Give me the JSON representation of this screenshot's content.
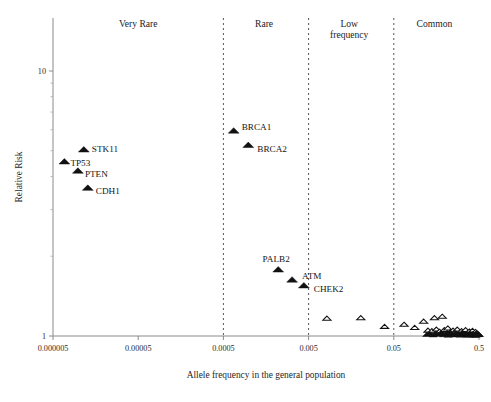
{
  "chart_data": {
    "type": "scatter",
    "title": "",
    "xlabel": "Allele frequency in the general population",
    "ylabel": "Relative Risk",
    "xscale": "log",
    "yscale": "log",
    "xlim": [
      5e-06,
      0.5
    ],
    "ylim": [
      1,
      20
    ],
    "xticks": [
      "0.000005",
      "0.00005",
      "0.0005",
      "0.005",
      "0.05",
      "0.5"
    ],
    "xtick_values": [
      5e-06,
      5e-05,
      0.0005,
      0.005,
      0.05,
      0.5
    ],
    "yticks": [
      "1",
      "10"
    ],
    "ytick_values": [
      1,
      10
    ],
    "grid": false,
    "legend": "none",
    "category_bands": [
      {
        "label": "Very Rare",
        "x_center": 5e-05,
        "range": [
          5e-06,
          0.0005
        ]
      },
      {
        "label": "Rare",
        "x_center": 0.0015,
        "range": [
          0.0005,
          0.005
        ]
      },
      {
        "label": "Low frequency",
        "x_center": 0.015,
        "range": [
          0.005,
          0.05
        ]
      },
      {
        "label": "Common",
        "x_center": 0.15,
        "range": [
          0.05,
          0.5
        ]
      }
    ],
    "separator_values": [
      0.0005,
      0.005,
      0.05
    ],
    "series": [
      {
        "name": "High penetrance / labelled genes",
        "marker": "filled-triangle",
        "points": [
          {
            "label": "TP53",
            "x": 6.8e-06,
            "y": 4.55,
            "label_dx": 6,
            "label_dy": 4
          },
          {
            "label": "STK11",
            "x": 1.15e-05,
            "y": 5.05,
            "label_dx": 8,
            "label_dy": 2
          },
          {
            "label": "PTEN",
            "x": 9.8e-06,
            "y": 4.2,
            "label_dx": 7,
            "label_dy": 6
          },
          {
            "label": "CDH1",
            "x": 1.28e-05,
            "y": 3.62,
            "label_dx": 8,
            "label_dy": 6
          },
          {
            "label": "BRCA1",
            "x": 0.00066,
            "y": 5.95,
            "label_dx": 8,
            "label_dy": -1
          },
          {
            "label": "BRCA2",
            "x": 0.00098,
            "y": 5.25,
            "label_dx": 9,
            "label_dy": 7
          },
          {
            "label": "PALB2",
            "x": 0.0022,
            "y": 1.78,
            "label_dx": -2,
            "label_dy": -8
          },
          {
            "label": "ATM",
            "x": 0.0032,
            "y": 1.63,
            "label_dx": 10,
            "label_dy": -1
          },
          {
            "label": "CHEK2",
            "x": 0.0044,
            "y": 1.55,
            "label_dx": 10,
            "label_dy": 6
          }
        ]
      },
      {
        "name": "Common low-penetrance variants",
        "marker": "open-triangle",
        "points": [
          {
            "x": 0.0082,
            "y": 1.165
          },
          {
            "x": 0.0205,
            "y": 1.17
          },
          {
            "x": 0.039,
            "y": 1.085
          },
          {
            "x": 0.066,
            "y": 1.105
          },
          {
            "x": 0.088,
            "y": 1.075
          },
          {
            "x": 0.112,
            "y": 1.135
          },
          {
            "x": 0.15,
            "y": 1.17
          },
          {
            "x": 0.185,
            "y": 1.185
          },
          {
            "x": 0.126,
            "y": 1.05
          },
          {
            "x": 0.14,
            "y": 1.045
          },
          {
            "x": 0.158,
            "y": 1.06
          },
          {
            "x": 0.172,
            "y": 1.04
          },
          {
            "x": 0.196,
            "y": 1.055
          },
          {
            "x": 0.215,
            "y": 1.07
          },
          {
            "x": 0.232,
            "y": 1.038
          },
          {
            "x": 0.248,
            "y": 1.05
          },
          {
            "x": 0.262,
            "y": 1.032
          },
          {
            "x": 0.278,
            "y": 1.06
          },
          {
            "x": 0.295,
            "y": 1.028
          },
          {
            "x": 0.312,
            "y": 1.045
          },
          {
            "x": 0.33,
            "y": 1.035
          },
          {
            "x": 0.348,
            "y": 1.055
          },
          {
            "x": 0.366,
            "y": 1.025
          },
          {
            "x": 0.385,
            "y": 1.042
          },
          {
            "x": 0.402,
            "y": 1.03
          },
          {
            "x": 0.42,
            "y": 1.048
          },
          {
            "x": 0.438,
            "y": 1.022
          },
          {
            "x": 0.455,
            "y": 1.038
          },
          {
            "x": 0.47,
            "y": 1.028
          },
          {
            "x": 0.485,
            "y": 1.018
          },
          {
            "x": 0.497,
            "y": 1.012
          }
        ]
      },
      {
        "name": "Common variants (filled cluster)",
        "marker": "filled-triangle",
        "points": [
          {
            "x": 0.122,
            "y": 1.012
          },
          {
            "x": 0.133,
            "y": 1.02
          },
          {
            "x": 0.145,
            "y": 1.008
          },
          {
            "x": 0.156,
            "y": 1.026
          },
          {
            "x": 0.168,
            "y": 1.014
          },
          {
            "x": 0.18,
            "y": 1.03
          },
          {
            "x": 0.192,
            "y": 1.01
          },
          {
            "x": 0.204,
            "y": 1.022
          },
          {
            "x": 0.217,
            "y": 1.006
          },
          {
            "x": 0.229,
            "y": 1.034
          },
          {
            "x": 0.241,
            "y": 1.016
          },
          {
            "x": 0.254,
            "y": 1.008
          },
          {
            "x": 0.266,
            "y": 1.028
          },
          {
            "x": 0.279,
            "y": 1.012
          },
          {
            "x": 0.291,
            "y": 1.02
          },
          {
            "x": 0.304,
            "y": 1.006
          },
          {
            "x": 0.316,
            "y": 1.03
          },
          {
            "x": 0.329,
            "y": 1.014
          },
          {
            "x": 0.341,
            "y": 1.022
          },
          {
            "x": 0.354,
            "y": 1.008
          },
          {
            "x": 0.366,
            "y": 1.018
          },
          {
            "x": 0.379,
            "y": 1.005
          },
          {
            "x": 0.392,
            "y": 1.026
          },
          {
            "x": 0.404,
            "y": 1.01
          },
          {
            "x": 0.417,
            "y": 1.02
          },
          {
            "x": 0.43,
            "y": 1.007
          },
          {
            "x": 0.443,
            "y": 1.016
          },
          {
            "x": 0.456,
            "y": 1.004
          },
          {
            "x": 0.468,
            "y": 1.022
          },
          {
            "x": 0.481,
            "y": 1.009
          },
          {
            "x": 0.493,
            "y": 1.014
          }
        ]
      }
    ]
  },
  "caption": {
    "text": ""
  }
}
